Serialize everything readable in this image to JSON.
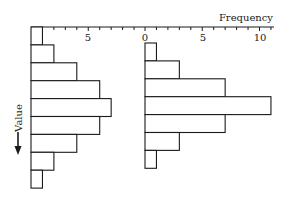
{
  "chart_data": [
    {
      "type": "bar",
      "orientation": "horizontal",
      "title": "",
      "xlabel": "Frequency",
      "ylabel": "Value",
      "categories": [
        "bin1",
        "bin2",
        "bin3",
        "bin4",
        "bin5",
        "bin6",
        "bin7",
        "bin8",
        "bin9"
      ],
      "values": [
        1,
        2,
        4,
        6,
        7,
        6,
        4,
        2,
        1
      ],
      "xlim": [
        0,
        10
      ],
      "x_tick_labels": [
        "5"
      ],
      "grid": false
    },
    {
      "type": "bar",
      "orientation": "horizontal",
      "title": "",
      "xlabel": "Frequency",
      "ylabel": "Value",
      "categories": [
        "bin1",
        "bin2",
        "bin3",
        "bin4",
        "bin5",
        "bin6",
        "bin7"
      ],
      "values": [
        1,
        3,
        7,
        11,
        7,
        3,
        1
      ],
      "xlim": [
        0,
        11
      ],
      "x_tick_labels": [
        "0",
        "5",
        "10"
      ],
      "grid": false
    }
  ],
  "labels": {
    "xlabel": "Frequency",
    "ylabel": "Value",
    "left_tick_5": "5",
    "right_tick_0": "0",
    "right_tick_5": "5",
    "right_tick_10": "10"
  },
  "colors": {
    "stroke": "#1a1a1a",
    "fill": "#ffffff"
  }
}
